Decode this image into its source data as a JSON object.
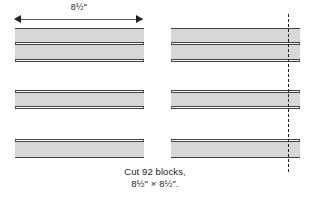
{
  "figure": {
    "name": "quilt-block-cutting-diagram",
    "dimension": {
      "label": "8½\"",
      "arrow_left": "left-arrowhead",
      "arrow_right": "right-arrowhead",
      "line": "dimension-line"
    },
    "blocks": [
      {
        "id": "left-block",
        "label": "pieced strip block",
        "strips": [
          {
            "fill": "shade",
            "top": 0,
            "height": 15
          },
          {
            "fill": "shade",
            "top": 16,
            "height": 16
          },
          {
            "fill": "plain",
            "top": 33,
            "height": 30
          },
          {
            "fill": "shade",
            "top": 64,
            "height": 15
          },
          {
            "fill": "plain",
            "top": 80,
            "height": 32
          },
          {
            "fill": "shade",
            "top": 113,
            "height": 17
          }
        ]
      },
      {
        "id": "right-block",
        "label": "pieced strip block with cut line",
        "strips": [
          {
            "fill": "shade",
            "top": 0,
            "height": 15
          },
          {
            "fill": "shade",
            "top": 16,
            "height": 16
          },
          {
            "fill": "plain",
            "top": 33,
            "height": 30
          },
          {
            "fill": "shade",
            "top": 64,
            "height": 15
          },
          {
            "fill": "plain",
            "top": 80,
            "height": 32
          },
          {
            "fill": "shade",
            "top": 113,
            "height": 17
          }
        ]
      }
    ],
    "cut_line": "dashed-cut-line",
    "caption": {
      "line1": "Cut 92 blocks,",
      "line2": "8½\" × 8½\"."
    },
    "colors": {
      "shade_fill": "#d6d7d8",
      "outline": "#414042",
      "edge": "#58595b",
      "text": "#231f20",
      "background": "#ffffff"
    }
  }
}
